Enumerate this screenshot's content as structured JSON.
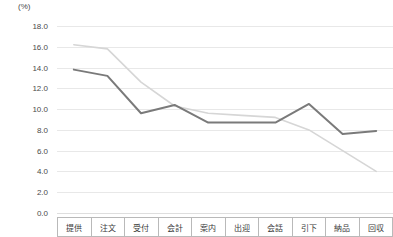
{
  "chart_data": {
    "type": "line",
    "title": "",
    "xlabel": "",
    "ylabel": "(%)",
    "unit_label": "(%)",
    "categories": [
      "提供",
      "注文",
      "受付",
      "会計",
      "案内",
      "出迎",
      "会話",
      "引下",
      "納品",
      "回収"
    ],
    "ylim": [
      0.0,
      18.0
    ],
    "ytick_step": 2.0,
    "ytick_labels": [
      "18.0",
      "16.0",
      "14.0",
      "12.0",
      "10.0",
      "8.0",
      "6.0",
      "4.0",
      "2.0",
      "0.0"
    ],
    "ytick_values": [
      18.0,
      16.0,
      14.0,
      12.0,
      10.0,
      8.0,
      6.0,
      4.0,
      2.0,
      0.0
    ],
    "grid": true,
    "legend": "none",
    "series": [
      {
        "name": "series-dark",
        "color": "#7a7a7a",
        "values": [
          13.8,
          13.2,
          9.6,
          10.4,
          8.7,
          8.7,
          8.7,
          10.5,
          7.6,
          7.9
        ]
      },
      {
        "name": "series-light",
        "color": "#d6d6d6",
        "values": [
          16.2,
          15.8,
          12.6,
          10.3,
          9.6,
          9.4,
          9.2,
          8.0,
          6.0,
          4.0
        ]
      }
    ]
  },
  "colors": {
    "grid": "#e8e8e8",
    "axis_text": "#4a4a4a",
    "table_border": "#b9b9b9",
    "series_dark": "#7a7a7a",
    "series_light": "#d6d6d6"
  }
}
